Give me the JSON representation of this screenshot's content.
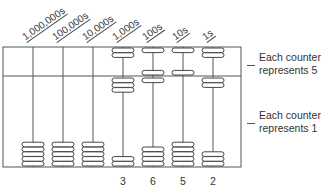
{
  "diagram": {
    "frame": {
      "left": 3,
      "right": 241,
      "top": 47,
      "divider": 76,
      "bottom": 167
    },
    "colors": {
      "line": "#555555",
      "bead_fill": "#ffffff",
      "bead_stroke": "#444444",
      "text": "#333333"
    },
    "columns": [
      {
        "place": "1,000,000s",
        "rod_x": 33,
        "upper_beads_down": 0,
        "lower_beads_up": 0,
        "digit": ""
      },
      {
        "place": "100,000s",
        "rod_x": 63,
        "upper_beads_down": 0,
        "lower_beads_up": 0,
        "digit": ""
      },
      {
        "place": "10,000s",
        "rod_x": 93,
        "upper_beads_down": 0,
        "lower_beads_up": 0,
        "digit": ""
      },
      {
        "place": "1,000s",
        "rod_x": 123,
        "upper_beads_down": 0,
        "lower_beads_up": 3,
        "digit": "3"
      },
      {
        "place": "100s",
        "rod_x": 153,
        "upper_beads_down": 1,
        "lower_beads_up": 1,
        "digit": "6"
      },
      {
        "place": "10s",
        "rod_x": 183,
        "upper_beads_down": 1,
        "lower_beads_up": 0,
        "digit": "5"
      },
      {
        "place": "1s",
        "rod_x": 213,
        "upper_beads_down": 0,
        "lower_beads_up": 2,
        "digit": "2"
      }
    ],
    "upper_beads_per_rod": 2,
    "lower_beads_per_rod": 5,
    "show_upper_beads_columns": [
      3,
      4,
      5,
      6
    ],
    "labels": {
      "upper_section": [
        "Each counter",
        "represents 5"
      ],
      "lower_section": [
        "Each counter",
        "represents 1"
      ]
    }
  }
}
